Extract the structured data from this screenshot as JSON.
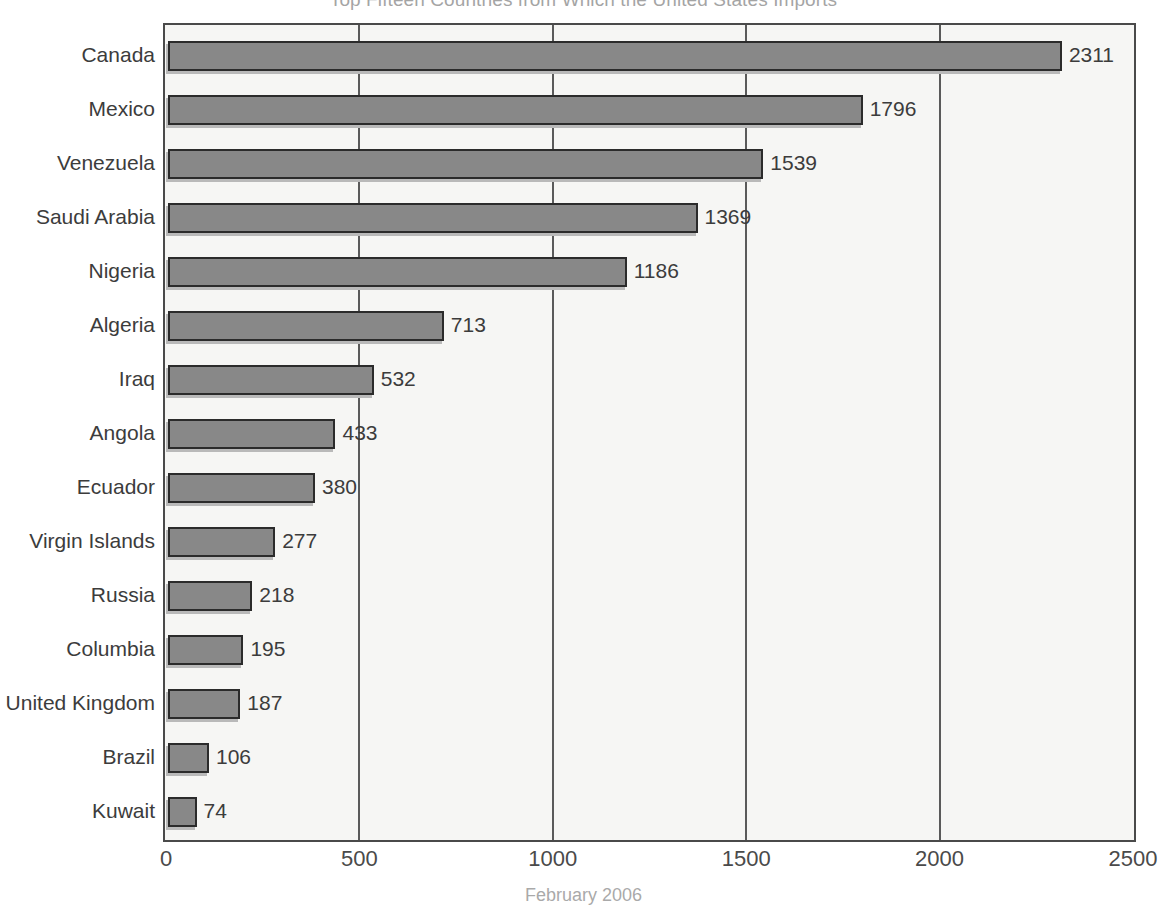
{
  "chart_data": {
    "type": "bar",
    "orientation": "horizontal",
    "title": "Top Fifteen Countries from Which the United States Imports",
    "caption": "February 2006",
    "xlabel": "",
    "ylabel": "",
    "xlim": [
      0,
      2500
    ],
    "ticks": [
      "0",
      "500",
      "1000",
      "1500",
      "2000",
      "2500"
    ],
    "tick_values": [
      0,
      500,
      1000,
      1500,
      2000,
      2500
    ],
    "grid": true,
    "legend": "none",
    "bar_color": "#888888",
    "bar_border_color": "#2b2b2b",
    "plot_background": "#f6f6f4",
    "categories": [
      "Canada",
      "Mexico",
      "Venezuela",
      "Saudi Arabia",
      "Nigeria",
      "Algeria",
      "Iraq",
      "Angola",
      "Ecuador",
      "Virgin Islands",
      "Russia",
      "Columbia",
      "United Kingdom",
      "Brazil",
      "Kuwait"
    ],
    "values": [
      2311,
      1796,
      1539,
      1369,
      1186,
      713,
      532,
      433,
      380,
      277,
      218,
      195,
      187,
      106,
      74
    ],
    "value_labels": [
      "2311",
      "1796",
      "1539",
      "1369",
      "1186",
      "713",
      "532",
      "433",
      "380",
      "277",
      "218",
      "195",
      "187",
      "106",
      "74"
    ]
  }
}
